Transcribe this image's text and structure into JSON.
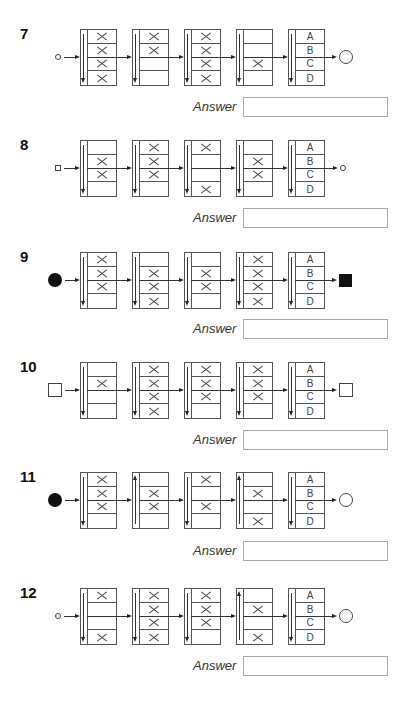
{
  "answer_label": "Answer",
  "option_labels": [
    "A",
    "B",
    "C",
    "D"
  ],
  "puzzles": [
    {
      "number": "7",
      "start_symbol": "small-circle",
      "end_symbol": "large-circle",
      "boxes": [
        {
          "arrow": "down",
          "x_rows": [
            1,
            2,
            3,
            4
          ]
        },
        {
          "arrow": "down",
          "x_rows": [
            1,
            2
          ]
        },
        {
          "arrow": "down",
          "x_rows": [
            1,
            2,
            3,
            4
          ]
        },
        {
          "arrow": "down",
          "x_rows": [
            3
          ]
        }
      ],
      "option_arrow": "down",
      "answer_value": ""
    },
    {
      "number": "8",
      "start_symbol": "small-square",
      "end_symbol": "small-circle",
      "boxes": [
        {
          "arrow": "down",
          "x_rows": [
            2,
            3
          ]
        },
        {
          "arrow": "down",
          "x_rows": [
            1,
            2,
            3
          ]
        },
        {
          "arrow": "down",
          "x_rows": [
            1,
            4
          ]
        },
        {
          "arrow": "down",
          "x_rows": [
            2,
            3
          ]
        }
      ],
      "option_arrow": "down",
      "answer_value": ""
    },
    {
      "number": "9",
      "start_symbol": "filled-circle",
      "end_symbol": "filled-square",
      "boxes": [
        {
          "arrow": "down",
          "x_rows": [
            1,
            2,
            3
          ]
        },
        {
          "arrow": "down",
          "x_rows": [
            2,
            3,
            4
          ]
        },
        {
          "arrow": "down",
          "x_rows": [
            2,
            3
          ]
        },
        {
          "arrow": "down",
          "x_rows": [
            1,
            2,
            3,
            4
          ]
        }
      ],
      "option_arrow": "down",
      "answer_value": ""
    },
    {
      "number": "10",
      "start_symbol": "large-square",
      "end_symbol": "large-square",
      "boxes": [
        {
          "arrow": "down",
          "x_rows": [
            2
          ]
        },
        {
          "arrow": "down",
          "x_rows": [
            1,
            2,
            3,
            4
          ]
        },
        {
          "arrow": "down",
          "x_rows": [
            1,
            2,
            3
          ]
        },
        {
          "arrow": "down",
          "x_rows": [
            1,
            2,
            3
          ]
        }
      ],
      "option_arrow": "down",
      "answer_value": ""
    },
    {
      "number": "11",
      "start_symbol": "filled-circle",
      "end_symbol": "large-circle",
      "boxes": [
        {
          "arrow": "down",
          "x_rows": [
            1,
            2,
            3
          ]
        },
        {
          "arrow": "up",
          "x_rows": [
            2,
            3
          ]
        },
        {
          "arrow": "down",
          "x_rows": [
            1,
            3
          ]
        },
        {
          "arrow": "up",
          "x_rows": [
            2,
            4
          ]
        }
      ],
      "option_arrow": "down",
      "answer_value": ""
    },
    {
      "number": "12",
      "start_symbol": "small-circle",
      "end_symbol": "large-circle",
      "boxes": [
        {
          "arrow": "down",
          "x_rows": [
            1,
            4
          ]
        },
        {
          "arrow": "down",
          "x_rows": [
            1,
            2,
            3,
            4
          ]
        },
        {
          "arrow": "down",
          "x_rows": [
            1,
            2,
            3
          ]
        },
        {
          "arrow": "up",
          "x_rows": [
            2,
            4
          ]
        }
      ],
      "option_arrow": "down",
      "answer_value": ""
    }
  ]
}
